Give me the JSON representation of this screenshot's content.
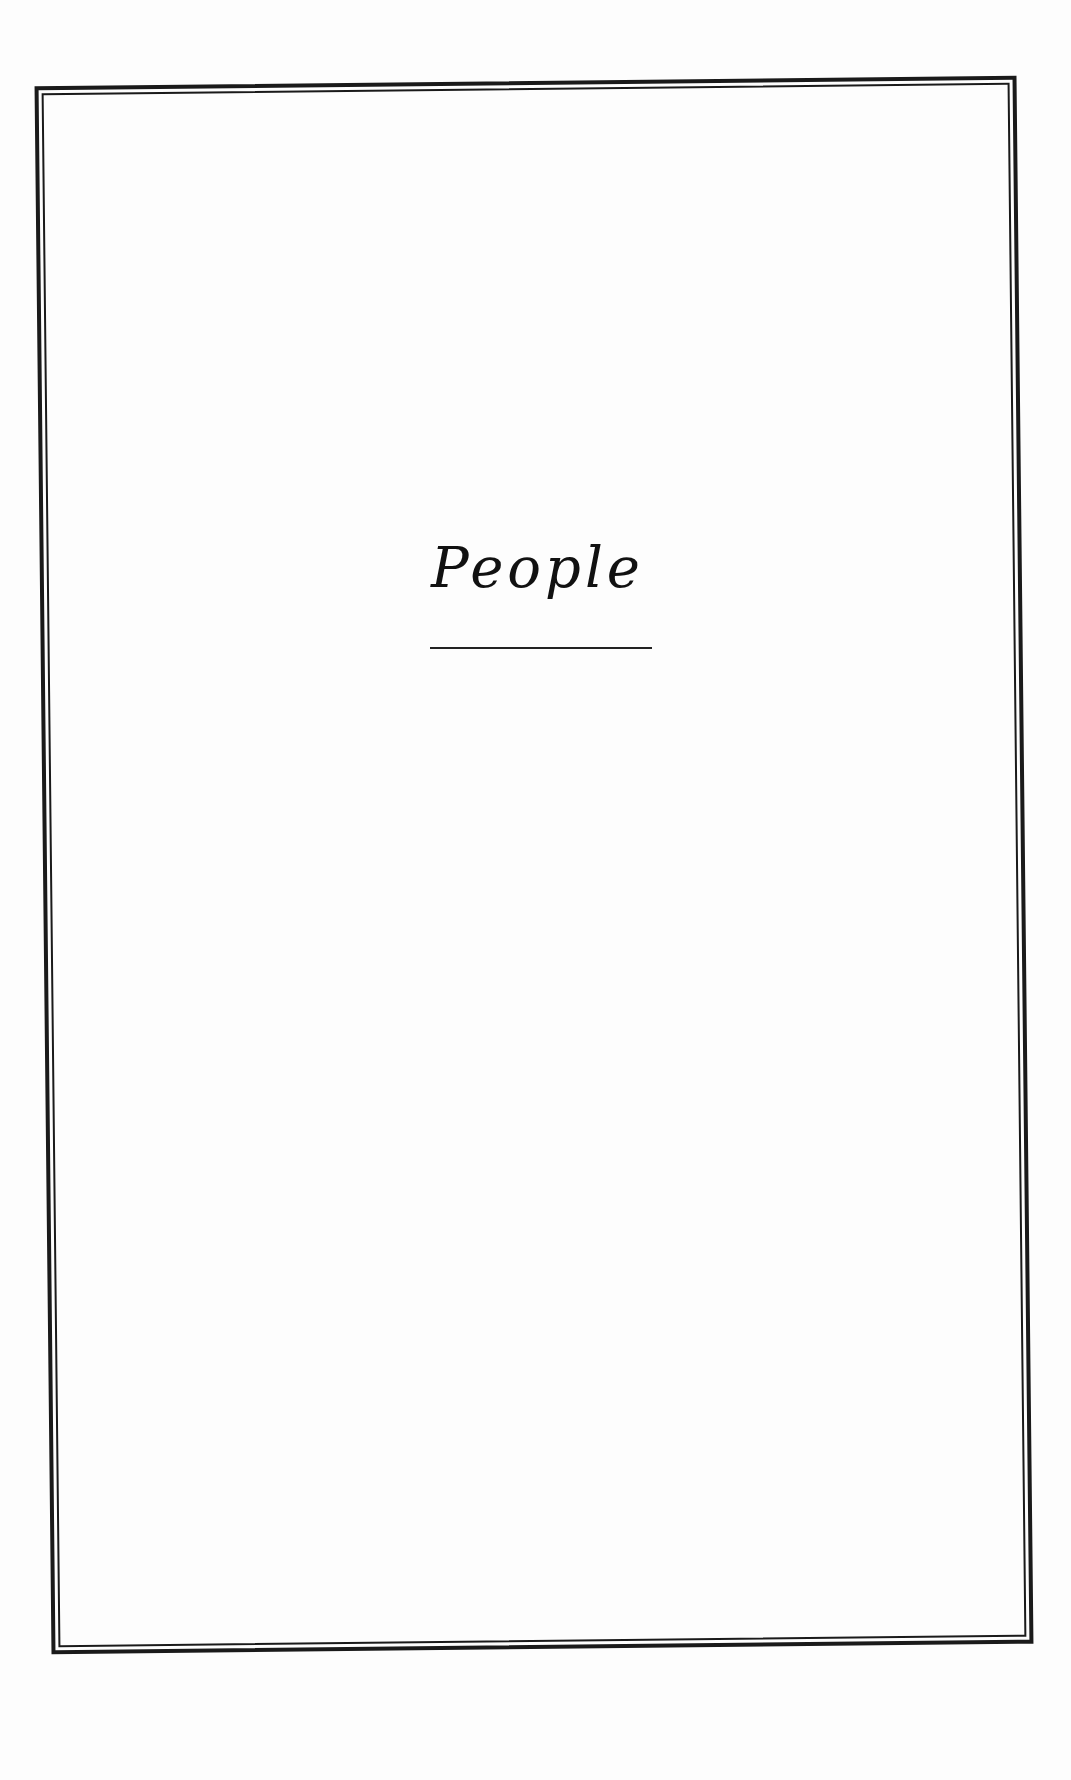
{
  "page": {
    "title": "People",
    "background_color": "#fdfdfd",
    "ink_color": "#111111",
    "frame": {
      "style": "double-line border",
      "color": "#1a1a1a"
    }
  }
}
